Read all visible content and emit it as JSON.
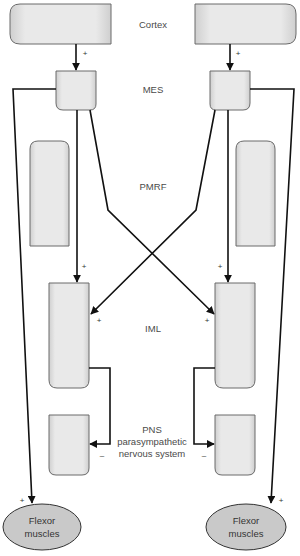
{
  "labels": {
    "cortex": "Cortex",
    "mes": "MES",
    "pmrf": "PMRF",
    "iml": "IML",
    "pns_line1": "PNS",
    "pns_line2": "parasympathetic",
    "pns_line3": "nervous system"
  },
  "effectors": {
    "left": {
      "line1": "Flexor",
      "line2": "muscles"
    },
    "right": {
      "line1": "Flexor",
      "line2": "muscles"
    }
  },
  "signs": {
    "excitatory": "+",
    "inhibitory": "–"
  },
  "colors": {
    "box_fill": "#e6e6e6",
    "box_stroke": "#6a6a6a",
    "ellipse_fill": "#c9c9c9",
    "wire": "#111111",
    "label": "#4a4a4a"
  }
}
